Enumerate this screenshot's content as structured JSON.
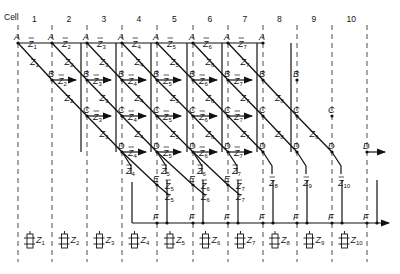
{
  "header": {
    "cell_label": "Cell",
    "cells": [
      "1",
      "2",
      "3",
      "4",
      "5",
      "6",
      "7",
      "8",
      "9",
      "10"
    ]
  },
  "nodes": {
    "row_labels": [
      "A",
      "B",
      "C",
      "D",
      "E",
      "F"
    ]
  },
  "signals": {
    "z": [
      "Z1",
      "Z2",
      "Z3",
      "Z4",
      "Z5",
      "Z6",
      "Z7",
      "Z8",
      "Z9",
      "Z10"
    ],
    "z_bar": [
      "Z̄1",
      "Z̄2",
      "Z̄3",
      "Z̄4",
      "Z̄5",
      "Z̄6",
      "Z̄7",
      "Z̄8",
      "Z̄9",
      "Z̄10"
    ]
  },
  "bottom_cells": [
    {
      "label": "Z1"
    },
    {
      "label": "Z2"
    },
    {
      "label": "Z3"
    },
    {
      "label": "Z4"
    },
    {
      "label": "Z5"
    },
    {
      "label": "Z6"
    },
    {
      "label": "Z7"
    },
    {
      "label": "Z8"
    },
    {
      "label": "Z9"
    },
    {
      "label": "Z10"
    }
  ],
  "colors": {
    "ink": "#111111",
    "background": "#ffffff"
  }
}
